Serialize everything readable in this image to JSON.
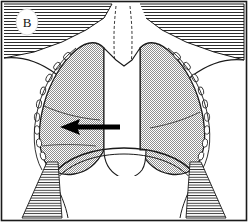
{
  "figure": {
    "type": "medical-line-illustration",
    "panel_label": "B",
    "frame": {
      "border_color": "#1a1a1a",
      "background_color": "#ffffff",
      "width": 248,
      "height": 222
    },
    "colors": {
      "ink": "#1a1a1a",
      "lung_fill": "#9a9a9a",
      "soft_tissue_hatch": "#2b2b2b",
      "paper": "#ffffff",
      "arrow": "#000000",
      "label_bubble": "#ffffff"
    },
    "annotations": [
      {
        "name": "panel-label",
        "text": "B",
        "shape": "oval",
        "x": 27,
        "y": 22
      },
      {
        "name": "pointer-arrow",
        "direction": "left",
        "tip_x": 62,
        "tip_y": 127,
        "tail_x": 120,
        "tail_y": 127,
        "points_to": "left-lower-lung-field"
      }
    ],
    "regions": [
      {
        "name": "supraclavicular-soft-tissue-left",
        "pattern": "horizontal-hatch"
      },
      {
        "name": "supraclavicular-soft-tissue-right",
        "pattern": "horizontal-hatch"
      },
      {
        "name": "lung-field-left",
        "pattern": "stipple-gray"
      },
      {
        "name": "lung-field-right",
        "pattern": "stipple-gray"
      },
      {
        "name": "trachea",
        "pattern": "outline-wavy"
      },
      {
        "name": "mediastinum-heart",
        "pattern": "blank-white"
      },
      {
        "name": "diaphragm-dome",
        "pattern": "blank-white"
      },
      {
        "name": "rib-cage-left",
        "pattern": "bead-outline"
      },
      {
        "name": "rib-cage-right",
        "pattern": "bead-outline"
      },
      {
        "name": "costophrenic-wedge-left",
        "pattern": "horizontal-hatch"
      },
      {
        "name": "costophrenic-wedge-right",
        "pattern": "horizontal-hatch"
      },
      {
        "name": "fissure-line-left",
        "pattern": "thin-line"
      },
      {
        "name": "fissure-line-right",
        "pattern": "thin-line"
      }
    ]
  }
}
